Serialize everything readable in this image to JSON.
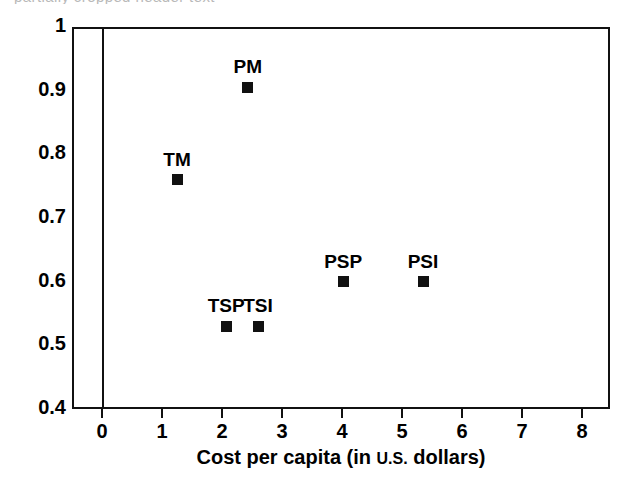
{
  "figure": {
    "background": "#ffffff",
    "ink_color": "#111111",
    "title_sliver": "partially cropped header text"
  },
  "chart_data": {
    "type": "scatter",
    "title": "",
    "xlabel": "Cost per capita (in U.S. dollars)",
    "ylabel": "",
    "xlim": [
      -0.5,
      8.5
    ],
    "ylim": [
      0.4,
      1.0
    ],
    "grid": false,
    "legend": "none",
    "xticks": [
      0,
      1,
      2,
      3,
      4,
      5,
      6,
      7,
      8
    ],
    "xtick_labels": [
      "0",
      "1",
      "2",
      "3",
      "4",
      "5",
      "6",
      "7",
      "8"
    ],
    "yticks": [
      0.4,
      0.5,
      0.6,
      0.7,
      0.8,
      0.9,
      1.0
    ],
    "ytick_labels": [
      "0.4",
      "0.5",
      "0.6",
      "0.7",
      "0.8",
      "0.9",
      "1"
    ],
    "marker": "filled-square",
    "points": [
      {
        "label": "PM",
        "x": 2.43,
        "y": 0.905,
        "label_position": "above"
      },
      {
        "label": "TM",
        "x": 1.25,
        "y": 0.76,
        "label_position": "above"
      },
      {
        "label": "PSP",
        "x": 4.02,
        "y": 0.6,
        "label_position": "above"
      },
      {
        "label": "PSI",
        "x": 5.35,
        "y": 0.6,
        "label_position": "above"
      },
      {
        "label": "TSP",
        "x": 2.07,
        "y": 0.53,
        "label_position": "above"
      },
      {
        "label": "TSI",
        "x": 2.6,
        "y": 0.53,
        "label_position": "above"
      }
    ]
  },
  "xlabel_parts": {
    "before": "Cost per capita (in ",
    "smallcaps": "U.S.",
    "after": " dollars)"
  }
}
